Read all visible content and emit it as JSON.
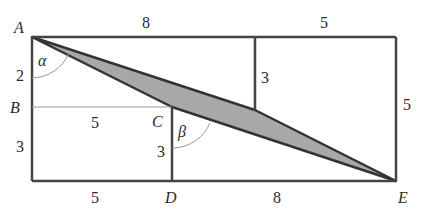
{
  "diagram": {
    "points": {
      "A": {
        "label": "A",
        "x": 32,
        "y": 37
      },
      "B": {
        "label": "B",
        "x": 32,
        "y": 107
      },
      "C": {
        "label": "C",
        "x": 172,
        "y": 107
      },
      "D": {
        "label": "D",
        "x": 172,
        "y": 181
      },
      "E": {
        "label": "E",
        "x": 396,
        "y": 181
      }
    },
    "angles": {
      "alpha": "α",
      "beta": "β"
    },
    "lengths": {
      "top_left": "8",
      "top_right": "5",
      "left_upper": "2",
      "left_lower": "3",
      "bc": "5",
      "cd": "3",
      "mid_vertical": "3",
      "right_side": "5",
      "bottom_left": "5",
      "bottom_right": "8"
    },
    "colors": {
      "stroke": "#333333",
      "thin_stroke": "#999999",
      "fill": "#a8a8a8"
    }
  }
}
